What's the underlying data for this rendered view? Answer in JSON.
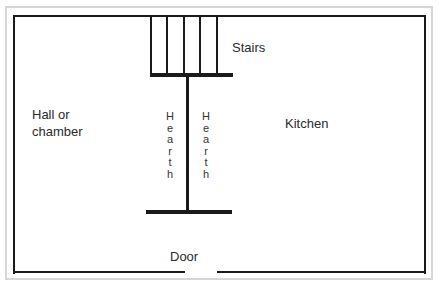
{
  "diagram": {
    "type": "floor-plan",
    "rooms": {
      "left": "Hall or chamber",
      "left_line1": "Hall or",
      "left_line2": "chamber",
      "right": "Kitchen"
    },
    "features": {
      "stairs": "Stairs",
      "hearth_left": "Hearth",
      "hearth_right": "Hearth",
      "door": "Door"
    },
    "colors": {
      "wall": "#1a1a1a",
      "frame": "#d6d6d6",
      "text": "#2a2a2a"
    }
  }
}
